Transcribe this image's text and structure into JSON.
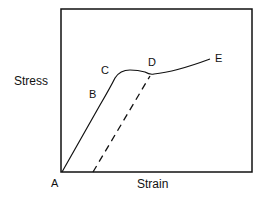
{
  "diagram": {
    "type": "stress-strain curve",
    "y_axis_label": "Stress",
    "x_axis_label": "Strain",
    "points": [
      {
        "id": "A",
        "label": "A"
      },
      {
        "id": "B",
        "label": "B"
      },
      {
        "id": "C",
        "label": "C"
      },
      {
        "id": "D",
        "label": "D"
      },
      {
        "id": "E",
        "label": "E"
      }
    ],
    "line_color": "#111111",
    "unloading_line_style": "dashed"
  }
}
